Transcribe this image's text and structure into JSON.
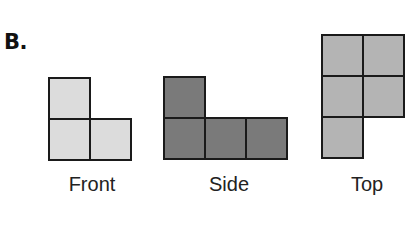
{
  "part": {
    "label": "B."
  },
  "views": [
    {
      "name": "Front",
      "color": "#dcdcdc",
      "origin": [
        48,
        77
      ],
      "cell_size": 43,
      "cells": [
        [
          0,
          0
        ],
        [
          0,
          1
        ],
        [
          1,
          1
        ]
      ]
    },
    {
      "name": "Side",
      "color": "#7a7a7a",
      "origin": [
        163,
        76
      ],
      "cell_size": 43,
      "cells": [
        [
          0,
          0
        ],
        [
          0,
          1
        ],
        [
          1,
          1
        ],
        [
          2,
          1
        ]
      ]
    },
    {
      "name": "Top",
      "color": "#b4b4b4",
      "origin": [
        321,
        34
      ],
      "cell_size": 43,
      "cells": [
        [
          0,
          0
        ],
        [
          1,
          0
        ],
        [
          0,
          1
        ],
        [
          1,
          1
        ],
        [
          0,
          2
        ]
      ]
    }
  ],
  "captions": {
    "front": "Front",
    "side": "Side",
    "top": "Top"
  }
}
